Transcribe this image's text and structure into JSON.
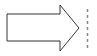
{
  "diagram": {
    "shapes": [
      {
        "type": "block-arrow",
        "direction": "right",
        "fill": "#ffffff",
        "stroke": "#333333"
      },
      {
        "type": "dashed-line",
        "orientation": "vertical",
        "stroke": "#888888"
      }
    ]
  }
}
